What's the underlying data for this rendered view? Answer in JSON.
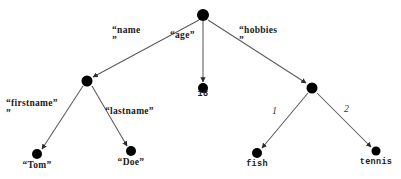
{
  "diagram": {
    "type": "json-object-tree",
    "background_color": "#ffffff",
    "node_color": "#000000",
    "edge_color": "#555555",
    "text_color": "#1a1a1a"
  },
  "nodes": {
    "root": {
      "id": "root",
      "label": "",
      "x": 203,
      "y": 15,
      "r": 6.0,
      "kind": "object"
    },
    "name_obj": {
      "id": "name_obj",
      "label": "",
      "x": 87,
      "y": 81,
      "r": 5.5,
      "kind": "object"
    },
    "age_value": {
      "id": "age_value",
      "label": "18",
      "x": 203,
      "y": 88,
      "r": 5.0,
      "kind": "value"
    },
    "hobbies_arr": {
      "id": "hobbies_arr",
      "label": "",
      "x": 312,
      "y": 88,
      "r": 5.5,
      "kind": "array"
    },
    "firstname": {
      "id": "firstname",
      "label": "\"Tom\"",
      "x": 37,
      "y": 154,
      "r": 5.0,
      "kind": "value"
    },
    "lastname": {
      "id": "lastname",
      "label": "\"Doe\"",
      "x": 131,
      "y": 151,
      "r": 5.0,
      "kind": "value"
    },
    "hobby1": {
      "id": "hobby1",
      "label": "fish",
      "x": 257,
      "y": 153,
      "r": 5.0,
      "kind": "value"
    },
    "hobby2": {
      "id": "hobby2",
      "label": "tennis",
      "x": 376,
      "y": 151,
      "r": 4.5,
      "kind": "value"
    }
  },
  "edges": [
    {
      "id": "e-name",
      "from": "root",
      "to": "name_obj",
      "label": "“name\n”",
      "label_x": 112,
      "label_y": 26,
      "style": "key"
    },
    {
      "id": "e-age",
      "from": "root",
      "to": "age_value",
      "label": "“age”",
      "label_x": 170,
      "label_y": 31,
      "style": "key"
    },
    {
      "id": "e-hobbies",
      "from": "root",
      "to": "hobbies_arr",
      "label": "“hobbies\n”",
      "label_x": 239,
      "label_y": 26,
      "style": "key"
    },
    {
      "id": "e-firstname",
      "from": "name_obj",
      "to": "firstname",
      "label": "“firstname”\n”",
      "label_x": 6,
      "label_y": 99,
      "style": "key"
    },
    {
      "id": "e-lastname",
      "from": "name_obj",
      "to": "lastname",
      "label": "“lastname”",
      "label_x": 105,
      "label_y": 107,
      "style": "key"
    },
    {
      "id": "e-hobby1",
      "from": "hobbies_arr",
      "to": "hobby1",
      "label": "1",
      "label_x": 272,
      "label_y": 106,
      "style": "index"
    },
    {
      "id": "e-hobby2",
      "from": "hobbies_arr",
      "to": "hobby2",
      "label": "2",
      "label_x": 344,
      "label_y": 104,
      "style": "index"
    }
  ],
  "labels": {
    "name": "“name\n”",
    "age": "“age”",
    "hobbies": "“hobbies\n”",
    "firstname": "“firstname”\n”",
    "lastname": "“lastname”",
    "index_1": "1",
    "index_2": "2",
    "value_age": "18",
    "value_firstname": "“Tom”",
    "value_lastname": "“Doe”",
    "value_hobby1": "fish",
    "value_hobby2": "tennis"
  }
}
